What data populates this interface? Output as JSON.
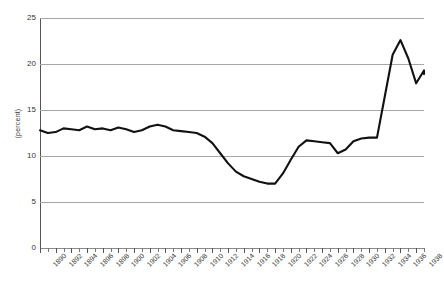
{
  "chart_data": {
    "type": "line",
    "title": "",
    "xlabel": "",
    "ylabel": "(percent)",
    "ylim": [
      0,
      25
    ],
    "xlim": [
      1890,
      1939
    ],
    "grid": true,
    "legend": null,
    "y_ticks": [
      0,
      5,
      10,
      15,
      20,
      25
    ],
    "x_tick_labels": [
      "1890",
      "1892",
      "1894",
      "1896",
      "1898",
      "1900",
      "1902",
      "1904",
      "1906",
      "1908",
      "1910",
      "1912",
      "1914",
      "1916",
      "1918",
      "1920",
      "1922",
      "1924",
      "1926",
      "1928",
      "1930",
      "1932",
      "1934",
      "1936",
      "1938"
    ],
    "x": [
      1890,
      1891,
      1892,
      1893,
      1894,
      1895,
      1896,
      1897,
      1898,
      1899,
      1900,
      1901,
      1902,
      1903,
      1904,
      1905,
      1906,
      1907,
      1908,
      1909,
      1910,
      1911,
      1912,
      1913,
      1914,
      1915,
      1916,
      1917,
      1918,
      1919,
      1920,
      1921,
      1922,
      1923,
      1924,
      1925,
      1926,
      1927,
      1928,
      1929,
      1930,
      1931,
      1932,
      1933,
      1934,
      1935,
      1936,
      1937,
      1938,
      1939
    ],
    "values": [
      12.8,
      12.5,
      12.6,
      13.0,
      12.9,
      12.8,
      13.2,
      12.9,
      13.0,
      12.8,
      13.1,
      12.9,
      12.6,
      12.8,
      13.2,
      13.4,
      13.2,
      12.8,
      12.7,
      12.6,
      12.5,
      12.1,
      11.4,
      10.3,
      9.2,
      8.3,
      7.8,
      7.5,
      7.2,
      7.0,
      7.0,
      8.1,
      9.6,
      11.0,
      11.7,
      11.6,
      11.5,
      11.4,
      10.3,
      10.7,
      11.6,
      11.9,
      12.0,
      12.0,
      16.5,
      21.0,
      22.6,
      20.6,
      17.9,
      19.3
    ],
    "final_value": 18.9,
    "series_color": "#111111",
    "grid_color": "#a6a6a6",
    "axis_color": "#555555"
  },
  "axis": {
    "y_title": "(percent)"
  },
  "caption": {
    "text": ""
  }
}
